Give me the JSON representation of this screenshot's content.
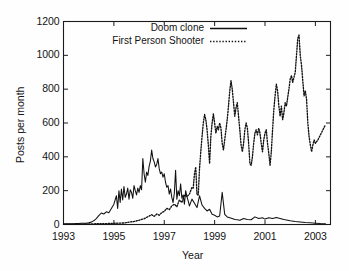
{
  "chart_data": {
    "type": "line",
    "title": "",
    "xlabel": "Year",
    "ylabel": "Posts per month",
    "xlim": [
      1993,
      2003.6
    ],
    "ylim": [
      0,
      1200
    ],
    "xticks": [
      "1993",
      "1995",
      "1997",
      "1999",
      "2001",
      "2003"
    ],
    "xtick_values": [
      1993,
      1995,
      1997,
      1999,
      2001,
      2003
    ],
    "yticks": [
      "0",
      "200",
      "400",
      "600",
      "800",
      "1000",
      "1200"
    ],
    "ytick_values": [
      0,
      200,
      400,
      600,
      800,
      1000,
      1200
    ],
    "grid": false,
    "legend_position": "top-center",
    "series": [
      {
        "name": "Doom clone",
        "style": "solid",
        "color": "#111111",
        "x": [
          1993.0,
          1993.1,
          1993.2,
          1993.3,
          1993.4,
          1993.5,
          1993.6,
          1993.7,
          1993.8,
          1993.9,
          1994.0,
          1994.1,
          1994.2,
          1994.3,
          1994.4,
          1994.5,
          1994.6,
          1994.7,
          1994.8,
          1994.9,
          1995.0,
          1995.1,
          1995.15,
          1995.2,
          1995.25,
          1995.3,
          1995.35,
          1995.4,
          1995.45,
          1995.5,
          1995.55,
          1995.6,
          1995.65,
          1995.7,
          1995.75,
          1995.8,
          1995.85,
          1995.9,
          1995.95,
          1996.0,
          1996.05,
          1996.1,
          1996.15,
          1996.2,
          1996.25,
          1996.3,
          1996.35,
          1996.4,
          1996.45,
          1996.5,
          1996.55,
          1996.6,
          1996.65,
          1996.7,
          1996.75,
          1996.8,
          1996.85,
          1996.9,
          1996.95,
          1997.0,
          1997.05,
          1997.1,
          1997.15,
          1997.2,
          1997.25,
          1997.3,
          1997.35,
          1997.4,
          1997.45,
          1997.5,
          1997.55,
          1997.6,
          1997.65,
          1997.7,
          1997.75,
          1997.8,
          1997.85,
          1997.9,
          1997.95,
          1998.0,
          1998.1,
          1998.2,
          1998.3,
          1998.4,
          1998.5,
          1998.6,
          1998.7,
          1998.8,
          1998.9,
          1999.0,
          1999.1,
          1999.2,
          1999.3,
          1999.4,
          1999.5,
          1999.6,
          1999.7,
          1999.8,
          1999.9,
          2000.0,
          2000.15,
          2000.3,
          2000.45,
          2000.6,
          2000.75,
          2000.9,
          2001.0,
          2001.15,
          2001.3,
          2001.45,
          2001.6,
          2001.75,
          2001.9,
          2002.0,
          2002.2,
          2002.4,
          2002.6,
          2002.8,
          2003.0,
          2003.2,
          2003.4
        ],
        "y": [
          4,
          4,
          4,
          5,
          5,
          6,
          6,
          7,
          7,
          8,
          10,
          14,
          22,
          35,
          52,
          68,
          62,
          75,
          70,
          95,
          120,
          170,
          95,
          200,
          130,
          210,
          145,
          225,
          160,
          180,
          215,
          150,
          205,
          190,
          155,
          230,
          200,
          175,
          215,
          190,
          230,
          205,
          390,
          300,
          250,
          310,
          290,
          345,
          375,
          440,
          390,
          370,
          340,
          355,
          390,
          330,
          300,
          310,
          280,
          300,
          250,
          220,
          230,
          180,
          210,
          160,
          130,
          185,
          320,
          150,
          200,
          170,
          240,
          155,
          175,
          120,
          200,
          165,
          140,
          110,
          150,
          125,
          100,
          170,
          115,
          95,
          80,
          90,
          60,
          55,
          45,
          50,
          190,
          60,
          45,
          40,
          35,
          30,
          28,
          25,
          35,
          30,
          28,
          45,
          35,
          40,
          32,
          40,
          35,
          42,
          36,
          30,
          25,
          22,
          18,
          15,
          12,
          10,
          8,
          6,
          5
        ]
      },
      {
        "name": "First Person Shooter",
        "style": "dotted",
        "color": "#111111",
        "x": [
          1993.0,
          1993.3,
          1993.6,
          1993.9,
          1994.0,
          1994.2,
          1994.4,
          1994.6,
          1994.8,
          1995.0,
          1995.2,
          1995.4,
          1995.6,
          1995.8,
          1996.0,
          1996.1,
          1996.2,
          1996.3,
          1996.4,
          1996.5,
          1996.6,
          1996.7,
          1996.8,
          1996.9,
          1997.0,
          1997.1,
          1997.2,
          1997.3,
          1997.4,
          1997.5,
          1997.6,
          1997.7,
          1997.8,
          1997.9,
          1998.0,
          1998.05,
          1998.1,
          1998.15,
          1998.2,
          1998.25,
          1998.3,
          1998.35,
          1998.4,
          1998.45,
          1998.5,
          1998.55,
          1998.6,
          1998.65,
          1998.7,
          1998.75,
          1998.8,
          1998.85,
          1998.9,
          1998.95,
          1999.0,
          1999.05,
          1999.1,
          1999.15,
          1999.2,
          1999.25,
          1999.3,
          1999.35,
          1999.4,
          1999.45,
          1999.5,
          1999.55,
          1999.6,
          1999.65,
          1999.7,
          1999.75,
          1999.8,
          1999.85,
          1999.9,
          1999.95,
          2000.0,
          2000.05,
          2000.1,
          2000.15,
          2000.2,
          2000.25,
          2000.3,
          2000.35,
          2000.4,
          2000.45,
          2000.5,
          2000.55,
          2000.6,
          2000.65,
          2000.7,
          2000.75,
          2000.8,
          2000.85,
          2000.9,
          2000.95,
          2001.0,
          2001.05,
          2001.1,
          2001.15,
          2001.2,
          2001.25,
          2001.3,
          2001.35,
          2001.4,
          2001.45,
          2001.5,
          2001.55,
          2001.6,
          2001.65,
          2001.7,
          2001.75,
          2001.8,
          2001.85,
          2001.9,
          2001.95,
          2002.0,
          2002.05,
          2002.1,
          2002.15,
          2002.2,
          2002.25,
          2002.3,
          2002.35,
          2002.4,
          2002.45,
          2002.5,
          2002.55,
          2002.6,
          2002.65,
          2002.7,
          2002.75,
          2002.8,
          2002.85,
          2002.9,
          2002.95,
          2003.0,
          2003.1,
          2003.2,
          2003.3,
          2003.4
        ],
        "y": [
          1,
          2,
          2,
          3,
          3,
          4,
          5,
          5,
          6,
          7,
          8,
          9,
          14,
          18,
          25,
          30,
          34,
          42,
          50,
          58,
          48,
          62,
          55,
          70,
          78,
          95,
          88,
          110,
          120,
          105,
          145,
          130,
          175,
          165,
          180,
          200,
          220,
          215,
          300,
          340,
          175,
          175,
          330,
          430,
          520,
          600,
          650,
          620,
          560,
          470,
          360,
          520,
          600,
          655,
          600,
          540,
          580,
          560,
          600,
          570,
          480,
          440,
          500,
          560,
          620,
          700,
          790,
          850,
          800,
          720,
          640,
          690,
          720,
          640,
          560,
          470,
          430,
          480,
          560,
          600,
          570,
          480,
          360,
          350,
          400,
          480,
          540,
          560,
          530,
          570,
          540,
          480,
          430,
          500,
          540,
          560,
          480,
          420,
          350,
          430,
          560,
          680,
          760,
          830,
          790,
          700,
          640,
          700,
          620,
          660,
          720,
          700,
          750,
          800,
          860,
          880,
          840,
          870,
          900,
          1000,
          1100,
          1120,
          1000,
          940,
          850,
          760,
          790,
          740,
          600,
          520,
          470,
          430,
          470,
          500,
          480,
          500,
          530,
          560,
          590
        ]
      }
    ]
  },
  "legend": {
    "entries": [
      {
        "label": "Doom clone",
        "style": "solid"
      },
      {
        "label": "First Person Shooter",
        "style": "dotted"
      }
    ]
  },
  "axes": {
    "x_axis_title": "Year",
    "y_axis_title": "Posts per month"
  }
}
